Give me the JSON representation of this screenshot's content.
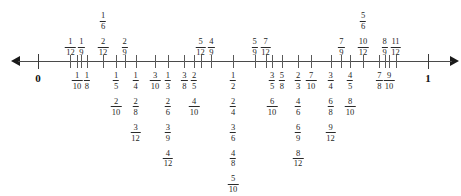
{
  "diagram": {
    "endpoints": {
      "start_label": "0",
      "end_label": "1"
    },
    "axis": {
      "min": 0,
      "max": 1,
      "left_arrow": "left-arrow-icon",
      "right_arrow": "right-arrow-icon"
    },
    "marks": [
      {
        "value": 0,
        "side": "below",
        "whole": true,
        "labels": []
      },
      {
        "value": 0.0833333,
        "side": "above",
        "labels": [
          {
            "n": "1",
            "d": "12"
          }
        ]
      },
      {
        "value": 0.1,
        "side": "below",
        "labels": [
          {
            "n": "1",
            "d": "10"
          }
        ]
      },
      {
        "value": 0.1111111,
        "side": "above",
        "labels": [
          {
            "n": "1",
            "d": "9"
          }
        ]
      },
      {
        "value": 0.125,
        "side": "below",
        "labels": [
          {
            "n": "1",
            "d": "8"
          }
        ]
      },
      {
        "value": 0.1666667,
        "side": "above",
        "labels": [
          {
            "n": "2",
            "d": "12"
          },
          {
            "n": "1",
            "d": "6"
          }
        ]
      },
      {
        "value": 0.2,
        "side": "below",
        "labels": [
          {
            "n": "1",
            "d": "5"
          },
          {
            "n": "2",
            "d": "10"
          }
        ]
      },
      {
        "value": 0.2222222,
        "side": "above",
        "labels": [
          {
            "n": "2",
            "d": "9"
          }
        ]
      },
      {
        "value": 0.25,
        "side": "below",
        "labels": [
          {
            "n": "1",
            "d": "4"
          },
          {
            "n": "2",
            "d": "8"
          },
          {
            "n": "3",
            "d": "12"
          }
        ]
      },
      {
        "value": 0.3,
        "side": "below",
        "labels": [
          {
            "n": "3",
            "d": "10"
          }
        ]
      },
      {
        "value": 0.3333333,
        "side": "below",
        "labels": [
          {
            "n": "1",
            "d": "3"
          },
          {
            "n": "2",
            "d": "6"
          },
          {
            "n": "3",
            "d": "9"
          },
          {
            "n": "4",
            "d": "12"
          }
        ]
      },
      {
        "value": 0.375,
        "side": "below",
        "labels": [
          {
            "n": "3",
            "d": "8"
          }
        ]
      },
      {
        "value": 0.4,
        "side": "below",
        "labels": [
          {
            "n": "2",
            "d": "5"
          },
          {
            "n": "4",
            "d": "10"
          }
        ]
      },
      {
        "value": 0.4166667,
        "side": "above",
        "labels": [
          {
            "n": "5",
            "d": "12"
          }
        ]
      },
      {
        "value": 0.4444444,
        "side": "above",
        "labels": [
          {
            "n": "4",
            "d": "9"
          }
        ]
      },
      {
        "value": 0.5,
        "side": "below",
        "labels": [
          {
            "n": "1",
            "d": "2"
          },
          {
            "n": "2",
            "d": "4"
          },
          {
            "n": "3",
            "d": "6"
          },
          {
            "n": "4",
            "d": "8"
          },
          {
            "n": "5",
            "d": "10"
          },
          {
            "n": "6",
            "d": "12"
          }
        ]
      },
      {
        "value": 0.5555556,
        "side": "above",
        "labels": [
          {
            "n": "5",
            "d": "9"
          }
        ]
      },
      {
        "value": 0.5833333,
        "side": "above",
        "labels": [
          {
            "n": "7",
            "d": "12"
          }
        ]
      },
      {
        "value": 0.6,
        "side": "below",
        "labels": [
          {
            "n": "3",
            "d": "5"
          },
          {
            "n": "6",
            "d": "10"
          }
        ]
      },
      {
        "value": 0.625,
        "side": "below",
        "labels": [
          {
            "n": "5",
            "d": "8"
          }
        ]
      },
      {
        "value": 0.6666667,
        "side": "below",
        "labels": [
          {
            "n": "2",
            "d": "3"
          },
          {
            "n": "4",
            "d": "6"
          },
          {
            "n": "6",
            "d": "9"
          },
          {
            "n": "8",
            "d": "12"
          }
        ]
      },
      {
        "value": 0.7,
        "side": "below",
        "labels": [
          {
            "n": "7",
            "d": "10"
          }
        ]
      },
      {
        "value": 0.75,
        "side": "below",
        "labels": [
          {
            "n": "3",
            "d": "4"
          },
          {
            "n": "6",
            "d": "8"
          },
          {
            "n": "9",
            "d": "12"
          }
        ]
      },
      {
        "value": 0.7777778,
        "side": "above",
        "labels": [
          {
            "n": "7",
            "d": "9"
          }
        ]
      },
      {
        "value": 0.8,
        "side": "below",
        "labels": [
          {
            "n": "4",
            "d": "5"
          },
          {
            "n": "8",
            "d": "10"
          }
        ]
      },
      {
        "value": 0.8333333,
        "side": "above",
        "labels": [
          {
            "n": "10",
            "d": "12"
          },
          {
            "n": "5",
            "d": "6"
          }
        ]
      },
      {
        "value": 0.875,
        "side": "below",
        "labels": [
          {
            "n": "7",
            "d": "8"
          }
        ]
      },
      {
        "value": 0.8888889,
        "side": "above",
        "labels": [
          {
            "n": "8",
            "d": "9"
          }
        ]
      },
      {
        "value": 0.9,
        "side": "below",
        "labels": [
          {
            "n": "9",
            "d": "10"
          }
        ]
      },
      {
        "value": 0.9166667,
        "side": "above",
        "labels": [
          {
            "n": "11",
            "d": "12"
          }
        ]
      },
      {
        "value": 1,
        "side": "below",
        "whole": true,
        "labels": []
      }
    ]
  }
}
